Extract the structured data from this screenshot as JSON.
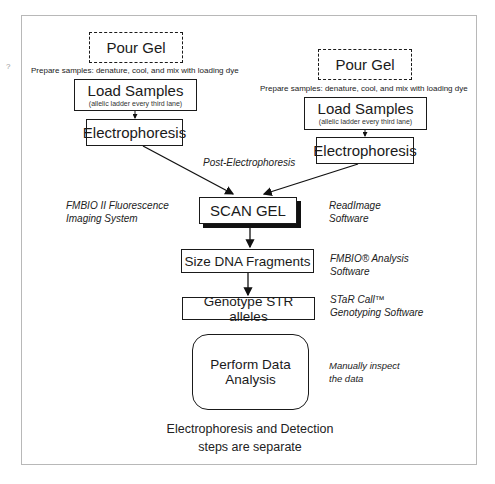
{
  "diagram": {
    "left_branch": {
      "pour_gel": "Pour Gel",
      "prep_note": "Prepare samples: denature, cool, and mix with loading dye",
      "load_samples": "Load Samples",
      "load_samples_sub": "(allelic ladder every third lane)",
      "electrophoresis": "Electrophoresis"
    },
    "right_branch": {
      "pour_gel": "Pour Gel",
      "prep_note": "Prepare samples: denature, cool, and mix with loading dye",
      "load_samples": "Load Samples",
      "load_samples_sub": "(allelic ladder every third lane)",
      "electrophoresis": "Electrophoresis"
    },
    "post_label": "Post-Electrophoresis",
    "steps": {
      "scan_gel": "SCAN GEL",
      "size_fragments": "Size DNA Fragments",
      "genotype": "Genotype STR alleles",
      "analysis_line1": "Perform Data",
      "analysis_line2": "Analysis"
    },
    "annotations": {
      "fmbio_system_1": "FMBIO II Fluorescence",
      "fmbio_system_2": "Imaging System",
      "readimage_1": "ReadImage",
      "readimage_2": "Software",
      "fmbio_analysis_1": "FMBIO® Analysis",
      "fmbio_analysis_2": "Software",
      "starcall_1": "STaR Call™",
      "starcall_2": "Genotyping Software",
      "manual_1": "Manually inspect",
      "manual_2": "the data"
    },
    "caption_line1": "Electrophoresis and Detection",
    "caption_line2": "steps are separate",
    "stray_mark": "?"
  }
}
